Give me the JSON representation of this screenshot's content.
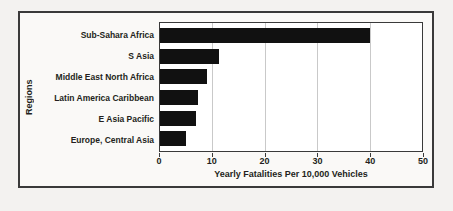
{
  "chart_data": {
    "type": "bar",
    "orientation": "horizontal",
    "title": "",
    "xlabel": "Yearly Fatalities Per 10,000 Vehicles",
    "ylabel": "Regions",
    "categories": [
      "Sub-Sahara Africa",
      "S Asia",
      "Middle East North Africa",
      "Latin America Caribbean",
      "E Asia Pacific",
      "Europe, Central Asia"
    ],
    "values": [
      40,
      11.2,
      9,
      7.2,
      6.8,
      5
    ],
    "xlim": [
      0,
      50
    ],
    "xticks": [
      0,
      10,
      20,
      30,
      40,
      50
    ],
    "xtick_labels": [
      "0",
      "10",
      "20",
      "30",
      "40",
      "50"
    ],
    "grid": "vertical",
    "legend": "none",
    "bar_color": "#111111",
    "plot_background": "#ffffff",
    "figure_background": "#faf9f7",
    "frame_color": "#3a3a3a",
    "gridline_color": "#c9c9c9"
  }
}
